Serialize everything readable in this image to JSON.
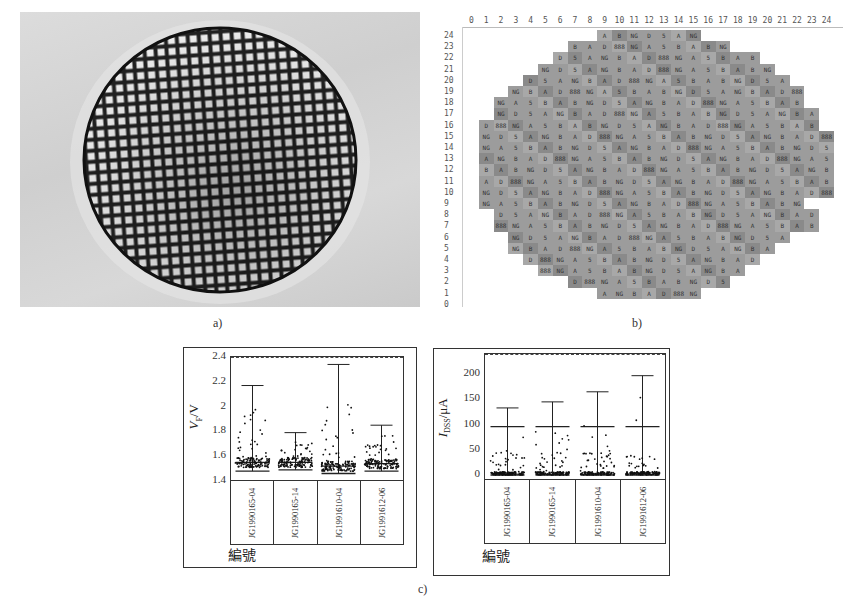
{
  "figure": {
    "panel_a": {
      "label": "a)",
      "description": "Photograph of wafer with square die grid"
    },
    "panel_b": {
      "label": "b)",
      "column_headers": [
        "0",
        "1",
        "2",
        "3",
        "4",
        "5",
        "6",
        "7",
        "8",
        "9",
        "10",
        "11",
        "12",
        "13",
        "14",
        "15",
        "16",
        "17",
        "18",
        "19",
        "20",
        "21",
        "22",
        "23",
        "24"
      ],
      "row_labels": [
        "24",
        "23",
        "22",
        "21",
        "20",
        "19",
        "18",
        "17",
        "16",
        "15",
        "14",
        "13",
        "12",
        "11",
        "10",
        "9",
        "8",
        "7",
        "6",
        "5",
        "4",
        "3",
        "2",
        "1",
        "0"
      ],
      "row_spans": {
        "24": [
          9,
          15
        ],
        "23": [
          7,
          17
        ],
        "22": [
          6,
          19
        ],
        "21": [
          5,
          20
        ],
        "20": [
          4,
          21
        ],
        "19": [
          3,
          22
        ],
        "18": [
          2,
          22
        ],
        "17": [
          2,
          23
        ],
        "16": [
          1,
          23
        ],
        "15": [
          1,
          24
        ],
        "14": [
          1,
          24
        ],
        "13": [
          1,
          24
        ],
        "12": [
          1,
          24
        ],
        "11": [
          1,
          24
        ],
        "10": [
          1,
          24
        ],
        "9": [
          1,
          22
        ],
        "8": [
          2,
          23
        ],
        "7": [
          2,
          23
        ],
        "6": [
          3,
          21
        ],
        "5": [
          3,
          20
        ],
        "4": [
          4,
          19
        ],
        "3": [
          5,
          18
        ],
        "2": [
          7,
          17
        ],
        "1": [
          9,
          15
        ]
      },
      "cell_codes": [
        "A",
        "B",
        "NG",
        "D",
        "5",
        "A",
        "NG",
        "B",
        "A",
        "D",
        "888",
        "NG",
        "A",
        "5",
        "B"
      ]
    },
    "panel_c": {
      "label": "c)"
    }
  },
  "chart_data": [
    {
      "type": "scatter",
      "title": "",
      "xlabel": "編號",
      "ylabel": "VF/V",
      "ylabel_main": "V",
      "ylabel_sub": "F",
      "ylabel_unit": "/V",
      "ylim": [
        1.4,
        2.4
      ],
      "yticks": [
        "2.4",
        "2.2",
        "2",
        "1.8",
        "1.6",
        "1.4"
      ],
      "categories": [
        "JG1990165-04",
        "JG1990165-14",
        "JG1991610-04",
        "JG1991612-06"
      ],
      "series": [
        {
          "name": "max",
          "values": [
            2.17,
            1.79,
            2.34,
            1.85
          ]
        },
        {
          "name": "median",
          "values": [
            1.55,
            1.55,
            1.52,
            1.54
          ]
        },
        {
          "name": "min",
          "values": [
            1.48,
            1.49,
            1.46,
            1.48
          ]
        }
      ],
      "grid": false
    },
    {
      "type": "scatter",
      "title": "",
      "xlabel": "編號",
      "ylabel": "IDSS/μA",
      "ylabel_main": "I",
      "ylabel_sub": "DSS",
      "ylabel_unit": "/μA",
      "ylim": [
        -10,
        240
      ],
      "yticks": [
        "200",
        "150",
        "100",
        "50",
        "0"
      ],
      "categories": [
        "JG1990165-04",
        "JG1990165-14",
        "JG1991610-04",
        "JG1991612-06"
      ],
      "series": [
        {
          "name": "max",
          "values": [
            133,
            145,
            165,
            197
          ]
        },
        {
          "name": "mean",
          "values": [
            96,
            96,
            96,
            96
          ]
        },
        {
          "name": "min",
          "values": [
            0,
            0,
            0,
            0
          ]
        }
      ],
      "grid": false
    }
  ]
}
